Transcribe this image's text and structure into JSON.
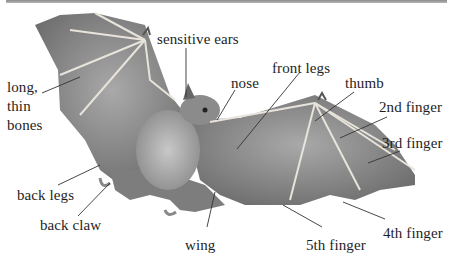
{
  "diagram": {
    "colors": {
      "top_bar": "#9f9f9f",
      "wing": "#8a8a8a",
      "bone": "#e8e4dc",
      "text": "#1e1e1e",
      "leader_line": "#333333"
    },
    "labels": [
      {
        "id": "sensitive-ears",
        "text": "sensitive ears"
      },
      {
        "id": "nose",
        "text": "nose"
      },
      {
        "id": "front-legs",
        "text": "front legs"
      },
      {
        "id": "thumb",
        "text": "thumb"
      },
      {
        "id": "long-thin-bones-1",
        "text": "long,"
      },
      {
        "id": "long-thin-bones-2",
        "text": "thin"
      },
      {
        "id": "long-thin-bones-3",
        "text": "bones"
      },
      {
        "id": "2nd-finger",
        "text": "2nd finger"
      },
      {
        "id": "3rd-finger",
        "text": "3rd finger"
      },
      {
        "id": "back-legs",
        "text": "back legs"
      },
      {
        "id": "back-claw",
        "text": "back claw"
      },
      {
        "id": "wing",
        "text": "wing"
      },
      {
        "id": "5th-finger",
        "text": "5th finger"
      },
      {
        "id": "4th-finger",
        "text": "4th finger"
      }
    ]
  }
}
